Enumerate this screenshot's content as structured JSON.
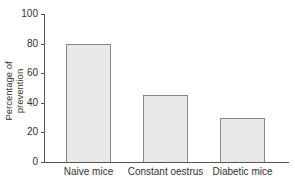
{
  "chart_data": {
    "type": "bar",
    "title": "",
    "xlabel": "",
    "ylabel": "Percentage of prevention",
    "categories": [
      "Naive mice",
      "Constant oestrus",
      "Diabetic mice"
    ],
    "values": [
      80,
      45,
      30
    ],
    "ylim": [
      0,
      100
    ],
    "yticks": [
      "0",
      "20",
      "40",
      "60",
      "80",
      "100"
    ],
    "grid": false,
    "bar_color": "#e9e9e9"
  }
}
